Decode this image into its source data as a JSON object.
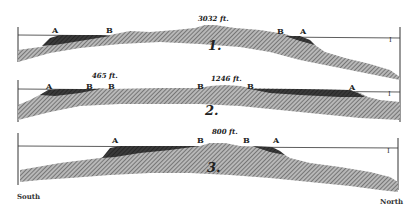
{
  "figure": {
    "type": "geological cross-sections",
    "orientation": {
      "left": "South",
      "right": "North"
    },
    "colors": {
      "rock_hatch": "#8a8a8a",
      "rock_dark": "#2e2e2e",
      "line": "#333333",
      "background": "#ffffff"
    }
  },
  "sections": [
    {
      "number": "1.",
      "elevation_label": "3032 ft.",
      "points": [
        {
          "label": "A",
          "x": 56,
          "y": 31
        },
        {
          "label": "B",
          "x": 110,
          "y": 30
        },
        {
          "label": "B",
          "x": 278,
          "y": 30
        },
        {
          "label": "A",
          "x": 303,
          "y": 31
        }
      ],
      "end_marker": "I"
    },
    {
      "number": "2.",
      "elevation_labels": [
        "465 ft.",
        "1246 ft."
      ],
      "points": [
        {
          "label": "A",
          "x": 47,
          "y": 84
        },
        {
          "label": "B",
          "x": 86,
          "y": 84
        },
        {
          "label": "B",
          "x": 108,
          "y": 84
        },
        {
          "label": "B",
          "x": 200,
          "y": 84
        },
        {
          "label": "B",
          "x": 248,
          "y": 84
        },
        {
          "label": "A",
          "x": 351,
          "y": 84
        }
      ],
      "end_marker": "I"
    },
    {
      "number": "3.",
      "elevation_label": "800 ft.",
      "points": [
        {
          "label": "A",
          "x": 113,
          "y": 138
        },
        {
          "label": "B",
          "x": 199,
          "y": 138
        },
        {
          "label": "B",
          "x": 244,
          "y": 138
        },
        {
          "label": "A",
          "x": 275,
          "y": 138
        }
      ],
      "end_marker": "I"
    }
  ],
  "labels": {
    "south": "South",
    "north": "North",
    "s1_num": "1.",
    "s1_elev": "3032 ft.",
    "s2_num": "2.",
    "s2_elev_a": "465 ft.",
    "s2_elev_b": "1246 ft.",
    "s3_num": "3.",
    "s3_elev": "800 ft.",
    "A": "A",
    "B": "B",
    "I": "I"
  }
}
